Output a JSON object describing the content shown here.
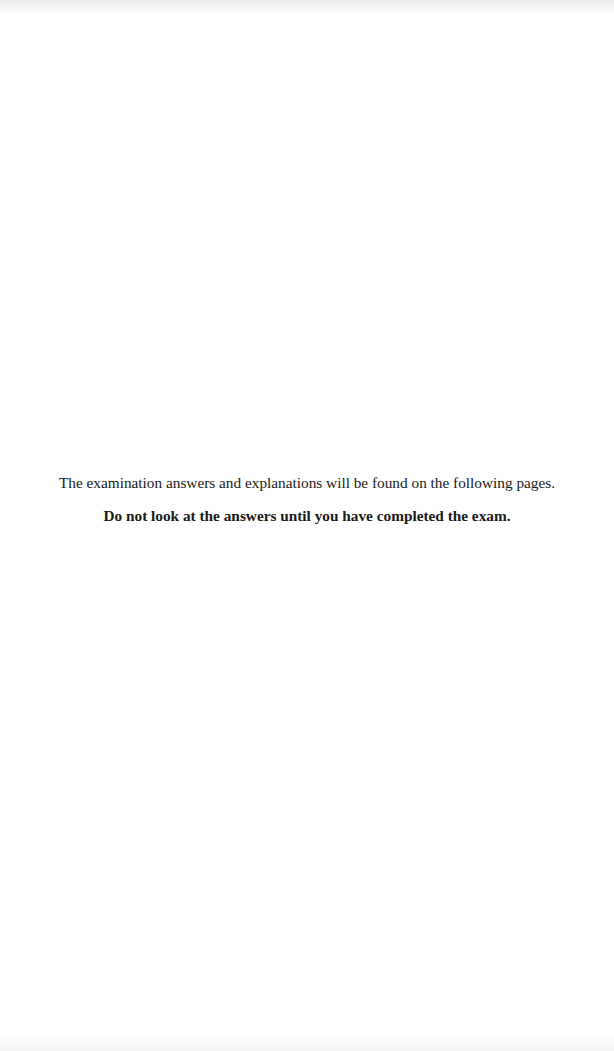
{
  "page": {
    "notice": {
      "line1": "The examination answers and explanations will be found on the following pages.",
      "line2": "Do not look at the answers until you have completed the exam."
    }
  }
}
